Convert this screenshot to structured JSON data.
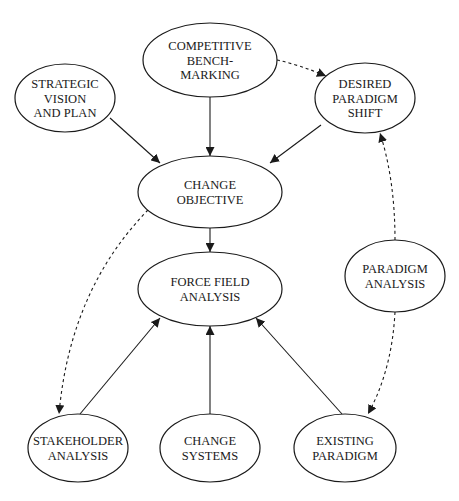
{
  "diagram": {
    "type": "flow",
    "nodes": [
      {
        "id": "competitive_benchmarking",
        "lines": [
          "COMPETITIVE",
          "BENCH-",
          "MARKING"
        ],
        "cx": 210,
        "cy": 60,
        "rx": 67,
        "ry": 37
      },
      {
        "id": "strategic_vision",
        "lines": [
          "STRATEGIC",
          "VISION",
          "AND PLAN"
        ],
        "cx": 65,
        "cy": 98,
        "rx": 50,
        "ry": 34
      },
      {
        "id": "desired_paradigm_shift",
        "lines": [
          "DESIRED",
          "PARADIGM",
          "SHIFT"
        ],
        "cx": 365,
        "cy": 98,
        "rx": 50,
        "ry": 35
      },
      {
        "id": "change_objective",
        "lines": [
          "CHANGE",
          "OBJECTIVE"
        ],
        "cx": 210,
        "cy": 192,
        "rx": 72,
        "ry": 36
      },
      {
        "id": "paradigm_analysis",
        "lines": [
          "PARADIGM",
          "ANALYSIS"
        ],
        "cx": 395,
        "cy": 276,
        "rx": 50,
        "ry": 36
      },
      {
        "id": "force_field_analysis",
        "lines": [
          "FORCE FIELD",
          "ANALYSIS"
        ],
        "cx": 210,
        "cy": 289,
        "rx": 72,
        "ry": 37
      },
      {
        "id": "stakeholder_analysis",
        "lines": [
          "STAKEHOLDER",
          "ANALYSIS"
        ],
        "cx": 78,
        "cy": 448,
        "rx": 50,
        "ry": 34
      },
      {
        "id": "change_systems",
        "lines": [
          "CHANGE",
          "SYSTEMS"
        ],
        "cx": 210,
        "cy": 448,
        "rx": 50,
        "ry": 34
      },
      {
        "id": "existing_paradigm",
        "lines": [
          "EXISTING",
          "PARADIGM"
        ],
        "cx": 345,
        "cy": 448,
        "rx": 51,
        "ry": 34
      }
    ],
    "edges": [
      {
        "from": "competitive_benchmarking",
        "to": "change_objective",
        "style": "solid",
        "path": "M210,97 L210,156"
      },
      {
        "from": "strategic_vision",
        "to": "change_objective",
        "style": "solid",
        "path": "M110,118 L160,163"
      },
      {
        "from": "desired_paradigm_shift",
        "to": "change_objective",
        "style": "solid",
        "path": "M321,125 L270,163"
      },
      {
        "from": "competitive_benchmarking",
        "to": "desired_paradigm_shift",
        "style": "dashed",
        "path": "M277,60 Q300,65 326,76"
      },
      {
        "from": "change_objective",
        "to": "force_field_analysis",
        "style": "solid",
        "path": "M210,228 L210,252"
      },
      {
        "from": "change_objective",
        "to": "stakeholder_analysis",
        "style": "dashed",
        "path": "M148,210 Q70,290 59,414"
      },
      {
        "from": "paradigm_analysis",
        "to": "desired_paradigm_shift",
        "style": "dashed",
        "path": "M395,240 Q395,180 380,133"
      },
      {
        "from": "paradigm_analysis",
        "to": "existing_paradigm",
        "style": "dashed",
        "path": "M395,312 Q392,370 368,414"
      },
      {
        "from": "stakeholder_analysis",
        "to": "force_field_analysis",
        "style": "solid",
        "path": "M80,414 L160,318"
      },
      {
        "from": "change_systems",
        "to": "force_field_analysis",
        "style": "solid",
        "path": "M210,414 L210,326"
      },
      {
        "from": "existing_paradigm",
        "to": "force_field_analysis",
        "style": "solid",
        "path": "M342,414 L256,318"
      }
    ]
  }
}
